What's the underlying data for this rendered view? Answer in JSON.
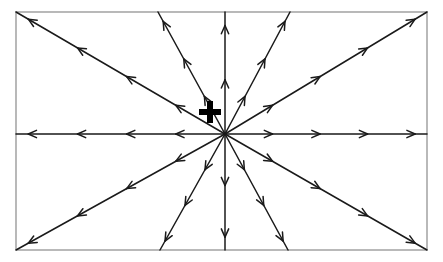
{
  "figure": {
    "kind": "vector-field",
    "background_color": "#ffffff",
    "line_color": "#1a1a1a",
    "border_color": "#8a8a8a",
    "plus_sign_color": "#000000"
  },
  "frame": {
    "name": "diagram-border",
    "x": 16,
    "y": 12,
    "width": 411,
    "height": 238,
    "stroke_width": 1.2
  },
  "charge": {
    "label": "+",
    "polarity": "positive",
    "symbol_x": 210,
    "symbol_y": 112,
    "symbol_size": 22,
    "source_x": 225,
    "source_y": 134
  },
  "chart_data": {
    "type": "scatter",
    "xlabel": "",
    "ylabel": "",
    "grid": false,
    "legend": null,
    "origin": {
      "x": 225,
      "y": 134
    },
    "field_direction": "outward",
    "ray_count": 12,
    "rays": [
      {
        "name": "ray-east",
        "direction": "east",
        "angle_deg": 0,
        "end_x": 427,
        "end_y": 134,
        "arrowheads": 4
      },
      {
        "name": "ray-northeast-shallow",
        "direction": "northeast-shallow",
        "angle_deg": 31,
        "end_x": 427,
        "end_y": 12,
        "arrowheads": 4
      },
      {
        "name": "ray-northeast-steep",
        "direction": "northeast-steep",
        "angle_deg": 62,
        "end_x": 290,
        "end_y": 12,
        "arrowheads": 3
      },
      {
        "name": "ray-north",
        "direction": "north",
        "angle_deg": 90,
        "end_x": 225,
        "end_y": 12,
        "arrowheads": 2
      },
      {
        "name": "ray-northwest-steep",
        "direction": "northwest-steep",
        "angle_deg": 118,
        "end_x": 158,
        "end_y": 12,
        "arrowheads": 3
      },
      {
        "name": "ray-northwest-shallow",
        "direction": "northwest-shallow",
        "angle_deg": 149,
        "end_x": 16,
        "end_y": 12,
        "arrowheads": 4
      },
      {
        "name": "ray-west",
        "direction": "west",
        "angle_deg": 180,
        "end_x": 16,
        "end_y": 134,
        "arrowheads": 4
      },
      {
        "name": "ray-southwest-shallow",
        "direction": "southwest-shallow",
        "angle_deg": 211,
        "end_x": 16,
        "end_y": 250,
        "arrowheads": 4
      },
      {
        "name": "ray-southwest-steep",
        "direction": "southwest-steep",
        "angle_deg": 241,
        "end_x": 160,
        "end_y": 250,
        "arrowheads": 3
      },
      {
        "name": "ray-south",
        "direction": "south",
        "angle_deg": 270,
        "end_x": 225,
        "end_y": 250,
        "arrowheads": 2
      },
      {
        "name": "ray-southeast-steep",
        "direction": "southeast-steep",
        "angle_deg": 299,
        "end_x": 288,
        "end_y": 250,
        "arrowheads": 3
      },
      {
        "name": "ray-southeast-shallow",
        "direction": "southeast-shallow",
        "angle_deg": 330,
        "end_x": 427,
        "end_y": 250,
        "arrowheads": 4
      }
    ]
  }
}
